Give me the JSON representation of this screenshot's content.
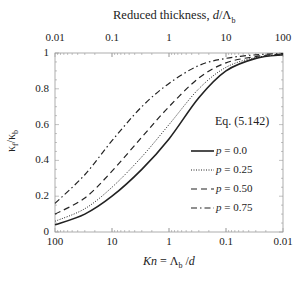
{
  "chart_data": {
    "type": "line",
    "title": "",
    "top_axis": {
      "label_prefix": "Reduced thickness, ",
      "label_var": "d",
      "label_sep": "/Λ",
      "label_sub": "b",
      "ticks": [
        "0.01",
        "0.1",
        "1",
        "10",
        "100"
      ],
      "scale": "log"
    },
    "xlabel": {
      "var": "Kn",
      "eq": " = Λ",
      "sub": "b",
      "tail": " /",
      "tail_var": "d"
    },
    "x_ticks": [
      "100",
      "10",
      "1",
      "0.1",
      "0.01"
    ],
    "xscale": "log-reversed",
    "xlim": [
      100,
      0.01
    ],
    "ylabel": {
      "main": "κ",
      "sub1": "f",
      "sep": "/κ",
      "sub2": "b"
    },
    "y_ticks": [
      "0",
      "0.2",
      "0.4",
      "0.6",
      "0.8",
      "1"
    ],
    "ylim": [
      0,
      1
    ],
    "annotation": "Eq. (5.142)",
    "grid": false,
    "legend_position": "right-center",
    "x": [
      100,
      30,
      10,
      3,
      1,
      0.3,
      0.1,
      0.03,
      0.01
    ],
    "series": [
      {
        "name": "p = 0.0",
        "p_label": "p",
        "p_value": " = 0.0",
        "style": "solid",
        "values": [
          0.04,
          0.1,
          0.2,
          0.35,
          0.52,
          0.75,
          0.9,
          0.97,
          0.99
        ]
      },
      {
        "name": "p = 0.25",
        "p_label": "p",
        "p_value": " = 0.25",
        "style": "dotted",
        "values": [
          0.06,
          0.13,
          0.25,
          0.42,
          0.6,
          0.8,
          0.92,
          0.975,
          0.99
        ]
      },
      {
        "name": "p = 0.50",
        "p_label": "p",
        "p_value": " = 0.50",
        "style": "dashed",
        "values": [
          0.1,
          0.19,
          0.34,
          0.53,
          0.7,
          0.86,
          0.945,
          0.98,
          0.995
        ]
      },
      {
        "name": "p = 0.75",
        "p_label": "p",
        "p_value": " = 0.75",
        "style": "dashdot",
        "values": [
          0.16,
          0.32,
          0.51,
          0.7,
          0.83,
          0.93,
          0.97,
          0.99,
          0.997
        ]
      }
    ]
  }
}
